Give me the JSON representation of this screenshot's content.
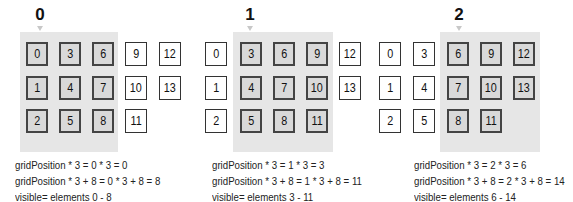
{
  "panels": [
    {
      "position_label": "0",
      "visible_range": [
        0,
        8
      ],
      "captions": [
        "gridPosition * 3 = 0 * 3 = 0",
        "gridPosition * 3 + 8 = 0 * 3 + 8 = 8",
        "visible= elements 0 - 8"
      ],
      "columns": [
        [
          "0",
          "1",
          "2"
        ],
        [
          "3",
          "4",
          "5"
        ],
        [
          "6",
          "7",
          "8"
        ],
        [
          "9",
          "10",
          "11"
        ],
        [
          "12",
          "13"
        ]
      ]
    },
    {
      "position_label": "1",
      "visible_range": [
        3,
        11
      ],
      "captions": [
        "gridPosition * 3 = 1 * 3 = 3",
        "gridPosition * 3 + 8 = 1 * 3 + 8 = 11",
        "visible= elements 3 - 11"
      ],
      "columns": [
        [
          "0",
          "1",
          "2"
        ],
        [
          "3",
          "4",
          "5"
        ],
        [
          "6",
          "7",
          "8"
        ],
        [
          "9",
          "10",
          "11"
        ],
        [
          "12",
          "13"
        ]
      ]
    },
    {
      "position_label": "2",
      "visible_range": [
        6,
        14
      ],
      "captions": [
        "gridPosition * 3 = 2 * 3 = 6",
        "gridPosition * 3 + 8 = 2 * 3 + 8 = 14",
        "visible= elements 6 - 14"
      ],
      "columns": [
        [
          "0",
          "1",
          "2"
        ],
        [
          "3",
          "4",
          "5"
        ],
        [
          "6",
          "7",
          "8"
        ],
        [
          "9",
          "10",
          "11"
        ],
        [
          "12",
          "13"
        ]
      ]
    }
  ],
  "colors": {
    "viewport_bg": "#e6e6e6",
    "visible_cell_bg": "#d9d9d9",
    "hidden_cell_bg": "#ffffff",
    "border": "#333333"
  }
}
